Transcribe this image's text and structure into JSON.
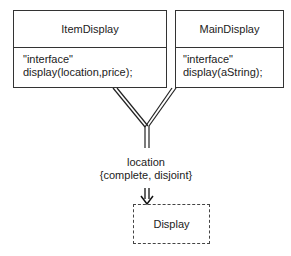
{
  "diagram": {
    "classes": [
      {
        "name": "ItemDisplay",
        "stereotype": "\"interface\"",
        "operation": "display(location,price);"
      },
      {
        "name": "MainDisplay",
        "stereotype": "\"interface\"",
        "operation": "display(aString);"
      }
    ],
    "generalization": {
      "discriminator": "location",
      "constraint": "{complete, disjoint}"
    },
    "superclass": {
      "name": "Display",
      "style": "dashed"
    },
    "colors": {
      "line": "#333333",
      "background": "#ffffff"
    }
  }
}
